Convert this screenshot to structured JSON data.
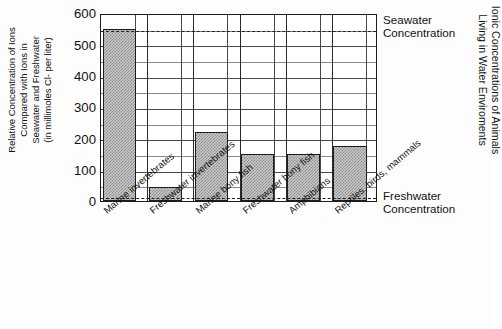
{
  "chart_data": {
    "type": "bar",
    "title": "Ionic Concentrations of Animals\nLiving in Water Enviroments",
    "ylabel": "Relative Concentration of Ions\nCompared with Ions in\nSeawater and Freshwater\n(in millimoles Cl- per liter)",
    "xlabel": "",
    "categories": [
      "Marine invertebrates",
      "Freshwater invertebrates",
      "Marine bony fish",
      "Freshwater bony fish",
      "Amphibians",
      "Reptiles, birds, mammals"
    ],
    "values": [
      550,
      45,
      220,
      150,
      150,
      175
    ],
    "ylim": [
      0,
      600
    ],
    "yticks": [
      0,
      100,
      200,
      300,
      400,
      500,
      600
    ],
    "ytick_labels": [
      "0",
      "100",
      "200",
      "300",
      "400",
      "500",
      "600"
    ],
    "minor_tick_step": 50,
    "grid": true,
    "legend": "none",
    "annotations": [
      {
        "label": "Seawater\nConcentration",
        "value": 550,
        "style": "dashed"
      },
      {
        "label": "Freshwater\nConcentration",
        "value": 15,
        "style": "dashed"
      }
    ],
    "colors": {
      "bar_fill": "#c9c9c9",
      "bar_pattern": "#8d8d8d",
      "bar_edge": "#1d1d1d",
      "grid": "#4a4a4a",
      "axis": "#1d1d1d",
      "background": "#fdfdfd",
      "text": "#111111"
    }
  },
  "axis": {
    "y_title": "Relative Concentration of Ions\nCompared with Ions in\nSeawater and Freshwater\n(in millimoles Cl- per liter)"
  },
  "side_title": "Ionic Concentrations of Animals\nLiving in Water Enviroments",
  "notes": {
    "seawater": "Seawater\nConcentration",
    "freshwater": "Freshwater\nConcentration"
  }
}
